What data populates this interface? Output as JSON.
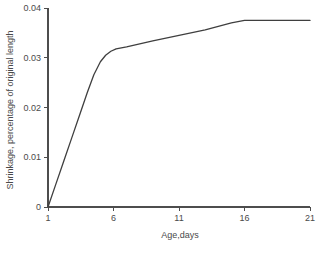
{
  "chart_data": {
    "type": "line",
    "title": "",
    "xlabel": "Age,days",
    "ylabel": "Shrinkage, percentage of original length",
    "xlim": [
      1,
      21
    ],
    "ylim": [
      0,
      0.04
    ],
    "xticks": [
      1,
      6,
      11,
      16,
      21
    ],
    "xtick_labels": [
      "1",
      "6",
      "11",
      "16",
      "21"
    ],
    "yticks": [
      0,
      0.01,
      0.02,
      0.03,
      0.04
    ],
    "ytick_labels": [
      "0",
      "0.01",
      "0.02",
      "0.03",
      "0.04"
    ],
    "grid": false,
    "legend": false,
    "legend_position": "none",
    "series": [
      {
        "name": "Shrinkage",
        "x": [
          1,
          1.6,
          2.2,
          2.8,
          3.4,
          4.0,
          4.5,
          5.0,
          5.4,
          5.8,
          6.2,
          7,
          9,
          11,
          13,
          15,
          16,
          18,
          19.5,
          21
        ],
        "values": [
          0,
          0.0046,
          0.0092,
          0.0138,
          0.0184,
          0.023,
          0.0266,
          0.0292,
          0.0305,
          0.0313,
          0.0318,
          0.0322,
          0.0334,
          0.0345,
          0.0356,
          0.037,
          0.0375,
          0.0375,
          0.0375,
          0.0375
        ]
      }
    ],
    "annotations": [],
    "colors": {
      "curve": "#3f3f3f",
      "axis": "#4d4d4d",
      "text": "#4a4a4a",
      "background": "#ffffff"
    },
    "geometry": {
      "left": 48,
      "right": 310,
      "top": 8,
      "bottom": 207,
      "ytop_value": 0.04
    }
  }
}
